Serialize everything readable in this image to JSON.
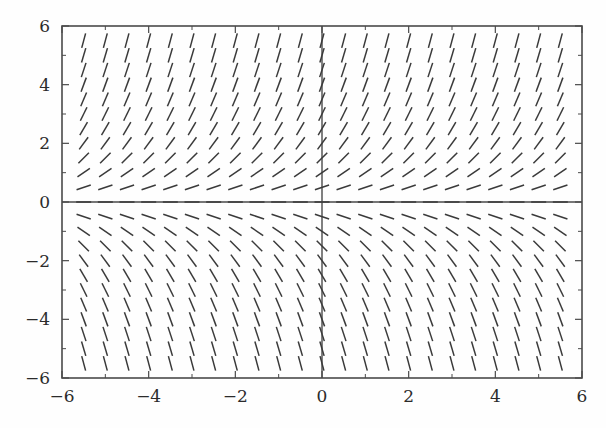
{
  "figure": {
    "title": "",
    "background_color": "#fefefe",
    "frame_color": "#4a4a4a",
    "tick_color": "#4a4a4a",
    "label_color": "#2b2b2b",
    "segment_color": "#3a3a3a"
  },
  "chart_data": {
    "type": "scatter",
    "subtype": "slope-field",
    "title": "",
    "xlabel": "",
    "ylabel": "",
    "xlim": [
      -6,
      6
    ],
    "ylim": [
      -6,
      6
    ],
    "grid": false,
    "legend": null,
    "xticks": [
      -6,
      -4,
      -2,
      0,
      2,
      4,
      6
    ],
    "xticklabels": [
      "-6",
      "-4",
      "-2",
      "0",
      "2",
      "4",
      "6"
    ],
    "yticks": [
      -6,
      -4,
      -2,
      0,
      2,
      4,
      6
    ],
    "yticklabels": [
      "6",
      "4",
      "2",
      "0",
      "-2",
      "-4",
      "-6"
    ],
    "minor_xticks": [
      -5,
      -3,
      -1,
      1,
      3,
      5
    ],
    "minor_yticks": [
      -5,
      -3,
      -1,
      1,
      3,
      5
    ],
    "axis_lines": {
      "x_axis_at_y": 0,
      "y_axis_at_x": 0
    },
    "field": {
      "slope_expression": "dy/dx = y",
      "segment_length_px": 15,
      "grid_x_start": -5.5,
      "grid_x_end": 5.5,
      "grid_x_step": 0.5,
      "grid_y_start": -5.5,
      "grid_y_end": 5.5,
      "grid_y_step": 0.5,
      "slope_sign_upper_half": "positive",
      "slope_sign_lower_half": "negative",
      "slope_near_zero": "nearly horizontal",
      "slope_at_extremes": "nearly vertical"
    },
    "sample_slopes": [
      {
        "x": -5.5,
        "y": 5.5,
        "slope": 5.5
      },
      {
        "x": -5.5,
        "y": 0.5,
        "slope": 0.5
      },
      {
        "x": 0.5,
        "y": 5.5,
        "slope": 5.5
      },
      {
        "x": 0.5,
        "y": 0.5,
        "slope": 0.5
      },
      {
        "x": 5.5,
        "y": 5.5,
        "slope": 5.5
      },
      {
        "x": -5.5,
        "y": -0.5,
        "slope": -0.5
      },
      {
        "x": -5.5,
        "y": -5.5,
        "slope": -5.5
      },
      {
        "x": 0.5,
        "y": -5.5,
        "slope": -5.5
      },
      {
        "x": 5.5,
        "y": -5.5,
        "slope": -5.5
      },
      {
        "x": 5.5,
        "y": -0.5,
        "slope": -0.5
      }
    ]
  }
}
